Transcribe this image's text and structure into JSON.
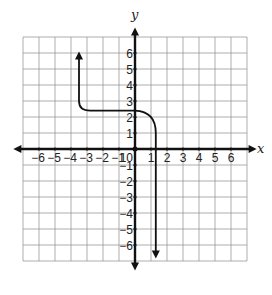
{
  "chart_data": {
    "type": "line",
    "title": "",
    "xlabel": "x",
    "ylabel": "y",
    "xlim": [
      -7,
      7
    ],
    "ylim": [
      -7,
      7
    ],
    "grid": true,
    "x_ticks": [
      "-6",
      "-5",
      "-4",
      "-3",
      "-2",
      "-1",
      "0",
      "1",
      "2",
      "3",
      "4",
      "5",
      "6"
    ],
    "y_ticks": [
      "6",
      "5",
      "4",
      "3",
      "2",
      "1",
      "-1",
      "-2",
      "-3",
      "-4",
      "-5",
      "-6"
    ],
    "origin_label": "0",
    "series": [
      {
        "name": "graph",
        "description": "Arrow pointing up at (-3.5, 6); vertical line down to (-3.5, 3); curves into horizontal segment at y≈2.4 from x≈-3 to x≈0; curves down near x≈1.3 and continues vertically to arrow at (1.3, -6.7)",
        "points": [
          [
            -3.5,
            6
          ],
          [
            -3.5,
            3
          ],
          [
            -3,
            2.4
          ],
          [
            0,
            2.4
          ],
          [
            1,
            2
          ],
          [
            1.3,
            1.2
          ],
          [
            1.3,
            -6.7
          ]
        ]
      }
    ]
  }
}
